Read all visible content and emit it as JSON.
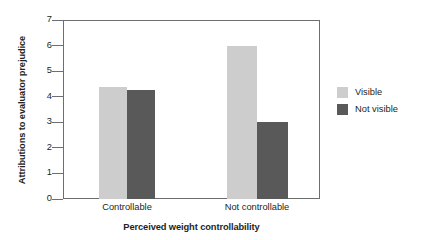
{
  "chart_data": {
    "type": "bar",
    "title": "",
    "subtitle": "",
    "xlabel": "Perceived weight controllability",
    "ylabel": "Attributions to evaluator prejudice",
    "categories": [
      "Controllable",
      "Not controllable"
    ],
    "series": [
      {
        "name": "Visible",
        "color": "#cdcdcd",
        "values": [
          4.4,
          6.0
        ]
      },
      {
        "name": "Not visible",
        "color": "#595959",
        "values": [
          4.25,
          3.0
        ]
      }
    ],
    "ylim": [
      0,
      7
    ],
    "ytick_labels": [
      "0",
      "1",
      "2",
      "3",
      "4",
      "5",
      "6",
      "7"
    ],
    "ytick_values": [
      0,
      1,
      2,
      3,
      4,
      5,
      6,
      7
    ],
    "grid": false,
    "legend_position": "right",
    "axis_color": "#6d6e70",
    "background": "#ffffff"
  },
  "legend": {
    "entries": [
      {
        "label": "Visible",
        "color": "#cdcdcd"
      },
      {
        "label": "Not visible",
        "color": "#595959"
      }
    ]
  }
}
